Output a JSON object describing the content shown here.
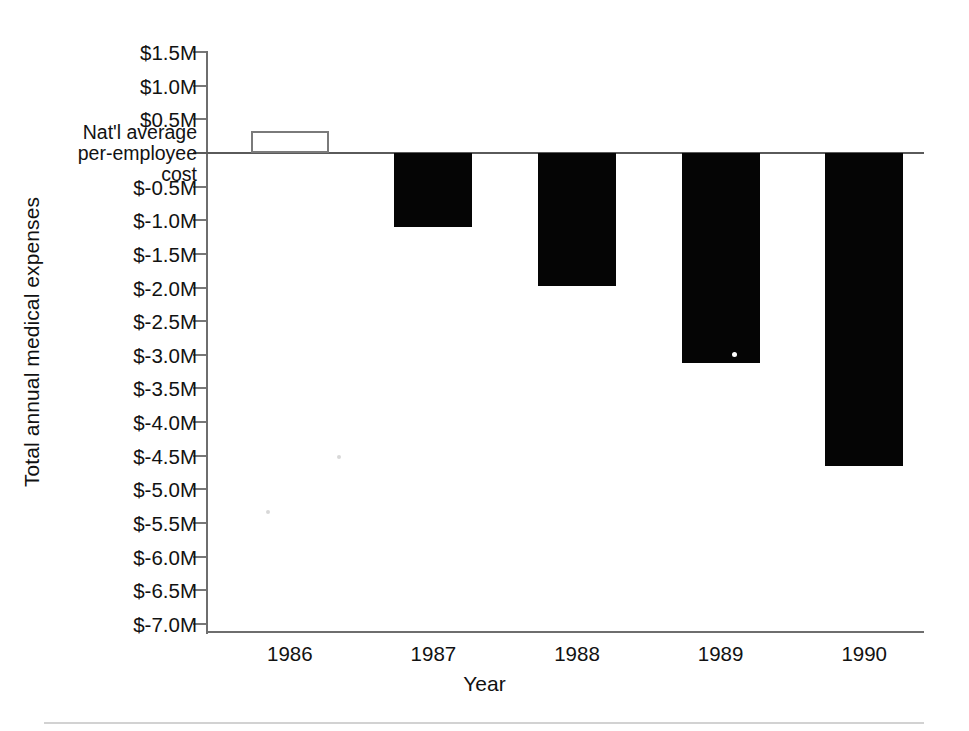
{
  "chart_data": {
    "type": "bar",
    "title": "",
    "xlabel": "Year",
    "ylabel": "Total annual medical expenses",
    "categories": [
      "1986",
      "1987",
      "1988",
      "1989",
      "1990"
    ],
    "values": [
      0.32,
      -1.1,
      -1.97,
      -3.12,
      -4.65
    ],
    "value_units": "millions of dollars",
    "ylim": [
      -7.0,
      1.5
    ],
    "ytick_values": [
      1.5,
      1.0,
      0.5,
      0.0,
      -0.5,
      -1.0,
      -1.5,
      -2.0,
      -2.5,
      -3.0,
      -3.5,
      -4.0,
      -4.5,
      -5.0,
      -5.5,
      -6.0,
      -6.5,
      -7.0
    ],
    "ytick_labels": [
      "$1.5M",
      "$1.0M",
      "$0.5M",
      "Nat'l average\nper-employee\ncost",
      "$-0.5M",
      "$-1.0M",
      "$-1.5M",
      "$-2.0M",
      "$-2.5M",
      "$-3.0M",
      "$-3.5M",
      "$-4.0M",
      "$-4.5M",
      "$-5.0M",
      "$-5.5M",
      "$-6.0M",
      "$-6.5M",
      "$-7.0M"
    ],
    "zero_label_lines": [
      "Nat'l average",
      "per-employee",
      "cost"
    ],
    "grid": false,
    "legend": "none",
    "bar_styles": [
      "hollow",
      "filled",
      "filled",
      "filled",
      "filled"
    ],
    "series": [
      {
        "name": "Total annual medical expenses",
        "values": [
          0.32,
          -1.1,
          -1.97,
          -3.12,
          -4.65
        ]
      }
    ]
  },
  "axis": {
    "y_title": "Total annual medical expenses",
    "x_title": "Year",
    "ticks": [
      {
        "label": "$1.5M",
        "value": 1.5,
        "multiline": false
      },
      {
        "label": "$1.0M",
        "value": 1.0,
        "multiline": false
      },
      {
        "label": "$0.5M",
        "value": 0.5,
        "multiline": false
      },
      {
        "label": "Nat'l average per-employee cost",
        "value": 0.0,
        "multiline": true
      },
      {
        "label": "$-0.5M",
        "value": -0.5,
        "multiline": false
      },
      {
        "label": "$-1.0M",
        "value": -1.0,
        "multiline": false
      },
      {
        "label": "$-1.5M",
        "value": -1.5,
        "multiline": false
      },
      {
        "label": "$-2.0M",
        "value": -2.0,
        "multiline": false
      },
      {
        "label": "$-2.5M",
        "value": -2.5,
        "multiline": false
      },
      {
        "label": "$-3.0M",
        "value": -3.0,
        "multiline": false
      },
      {
        "label": "$-3.5M",
        "value": -3.5,
        "multiline": false
      },
      {
        "label": "$-4.0M",
        "value": -4.0,
        "multiline": false
      },
      {
        "label": "$-4.5M",
        "value": -4.5,
        "multiline": false
      },
      {
        "label": "$-5.0M",
        "value": -5.0,
        "multiline": false
      },
      {
        "label": "$-5.5M",
        "value": -5.5,
        "multiline": false
      },
      {
        "label": "$-6.0M",
        "value": -6.0,
        "multiline": false
      },
      {
        "label": "$-6.5M",
        "value": -6.5,
        "multiline": false
      },
      {
        "label": "$-7.0M",
        "value": -7.0,
        "multiline": false
      }
    ],
    "zero_line_label_1": "Nat'l average",
    "zero_line_label_2": "per-employee",
    "zero_line_label_3": "cost"
  },
  "colors": {
    "bar_fill": "#050505",
    "bar_outline": "#7a7a7a",
    "axis": "#6e6e6e",
    "text": "#121212",
    "background": "#ffffff"
  }
}
